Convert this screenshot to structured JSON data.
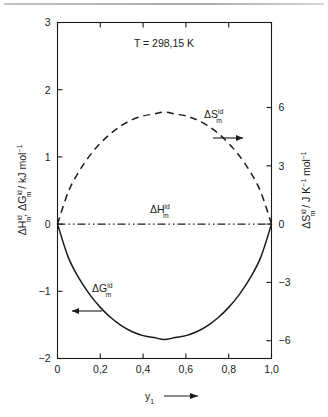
{
  "figure": {
    "name": "ideal-mixing-thermodynamic-functions",
    "background": "#ffffff",
    "ink": "#1a1a1a"
  },
  "chart_data": {
    "type": "line",
    "title": "",
    "annotation": "T = 298,15 K",
    "xlabel": "y",
    "xlabel_sub": "1",
    "xlabel_arrow": "⟶",
    "xlim": [
      0,
      1
    ],
    "xticks": [
      0,
      0.2,
      0.4,
      0.6,
      0.8,
      1.0
    ],
    "xtick_labels": [
      "0",
      "0,2",
      "0,4",
      "0,6",
      "0,8",
      "1,0"
    ],
    "grid": false,
    "legend": "none",
    "left_axis": {
      "label_parts": [
        "ΔH",
        "id",
        "m",
        ", ΔG",
        "id",
        "m",
        " / kJ mol",
        "−1"
      ],
      "label_plain": "ΔHᵐⁱᵈ, ΔGᵐⁱᵈ / kJ mol⁻¹",
      "ylim": [
        -2,
        3
      ],
      "yticks": [
        -2,
        -1,
        0,
        1,
        2,
        3
      ],
      "ytick_labels": [
        "−2",
        "−1",
        "0",
        "1",
        "2",
        "3"
      ],
      "units": "kJ mol⁻¹"
    },
    "right_axis": {
      "label_parts": [
        "ΔS",
        "id",
        "m",
        " / J K",
        "−1",
        " mol",
        "−1"
      ],
      "label_plain": "ΔSᵐⁱᵈ / J K⁻¹ mol⁻¹",
      "ylim": [
        -6.9165,
        10.3748
      ],
      "yticks": [
        -6,
        -3,
        0,
        3,
        6
      ],
      "ytick_labels": [
        "−6",
        "−3",
        "0",
        "3",
        "6"
      ],
      "units": "J K⁻¹ mol⁻¹"
    },
    "series": [
      {
        "name": "ΔG_m^id",
        "label_parts": [
          "ΔG",
          "id",
          "m"
        ],
        "label_plain": "ΔGᵐⁱᵈ",
        "style": "solid",
        "axis": "left",
        "arrow": "left",
        "units": "kJ mol⁻¹",
        "x": [
          0,
          0.05,
          0.1,
          0.15,
          0.2,
          0.25,
          0.3,
          0.35,
          0.4,
          0.45,
          0.5,
          0.55,
          0.6,
          0.65,
          0.7,
          0.75,
          0.8,
          0.85,
          0.9,
          0.95,
          1
        ],
        "values": [
          0,
          -0.4918,
          -0.8055,
          -1.0459,
          -1.2392,
          -1.394,
          -1.5143,
          -1.6025,
          -1.66,
          -1.688,
          -1.718,
          -1.688,
          -1.66,
          -1.6025,
          -1.5143,
          -1.394,
          -1.2392,
          -1.0459,
          -0.8055,
          -0.4918,
          0
        ]
      },
      {
        "name": "ΔH_m^id",
        "label_parts": [
          "ΔH",
          "id",
          "m"
        ],
        "label_plain": "ΔHᵐⁱᵈ",
        "style": "dash-dot",
        "axis": "left",
        "arrow": "none",
        "units": "kJ mol⁻¹",
        "x": [
          0,
          0.25,
          0.5,
          0.75,
          1
        ],
        "values": [
          0,
          0,
          0,
          0,
          0
        ]
      },
      {
        "name": "ΔS_m^id",
        "label_parts": [
          "ΔS",
          "id",
          "m"
        ],
        "label_plain": "ΔSᵐⁱᵈ",
        "style": "dashed",
        "axis": "right",
        "arrow": "right",
        "units": "J K⁻¹ mol⁻¹",
        "x": [
          0,
          0.05,
          0.1,
          0.15,
          0.2,
          0.25,
          0.3,
          0.35,
          0.4,
          0.45,
          0.5,
          0.55,
          0.6,
          0.65,
          0.7,
          0.75,
          0.8,
          0.85,
          0.9,
          0.95,
          1
        ],
        "values": [
          0,
          1.6499,
          2.7022,
          3.5094,
          4.1578,
          4.6771,
          5.0807,
          5.3767,
          5.5695,
          5.6634,
          5.7632,
          5.6634,
          5.5695,
          5.3767,
          5.0807,
          4.6771,
          4.1578,
          3.5094,
          2.7022,
          1.6499,
          0
        ]
      }
    ]
  }
}
